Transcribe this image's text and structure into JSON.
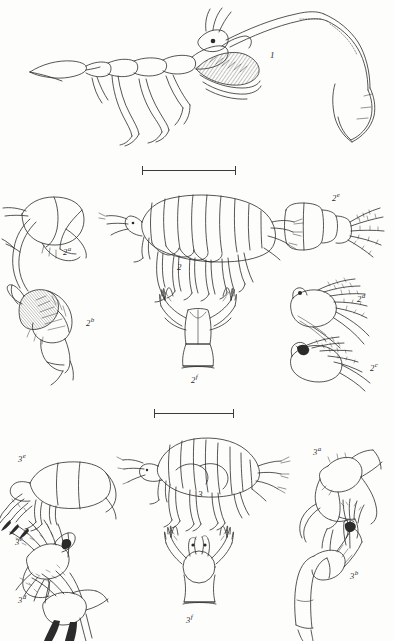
{
  "plate": {
    "background_color": "#fdfdfc",
    "ink_color": "#2b2b2b",
    "width": 395,
    "height": 641
  },
  "figures": [
    {
      "id": "fig-1",
      "number": "1",
      "suffix": "",
      "label_x": 270,
      "label_y": 51,
      "label_size": "main",
      "subject": "enlarged-segmented-appendage-with-hatched-shading"
    },
    {
      "id": "fig-2a",
      "number": "2",
      "suffix": "a",
      "label_x": 63,
      "label_y": 246,
      "label_size": "sub",
      "subject": "head-with-curved-antenna"
    },
    {
      "id": "fig-2",
      "number": "2",
      "suffix": "",
      "label_x": 177,
      "label_y": 263,
      "label_size": "main",
      "subject": "amphipod-whole-body-lateral-view"
    },
    {
      "id": "fig-2e",
      "number": "2",
      "suffix": "e",
      "label_x": 332,
      "label_y": 192,
      "label_size": "sub",
      "subject": "pleon-segments-with-uropods"
    },
    {
      "id": "fig-2b",
      "number": "2",
      "suffix": "b",
      "label_x": 86,
      "label_y": 317,
      "label_size": "sub",
      "subject": "gnathopod-with-shaded-propodus"
    },
    {
      "id": "fig-2f",
      "number": "2",
      "suffix": "f",
      "label_x": 191,
      "label_y": 374,
      "label_size": "sub",
      "subject": "telson-and-uropods-dorsal-view"
    },
    {
      "id": "fig-2d",
      "number": "2",
      "suffix": "d",
      "label_x": 357,
      "label_y": 293,
      "label_size": "sub",
      "subject": "setose-appendage-upper"
    },
    {
      "id": "fig-2c",
      "number": "2",
      "suffix": "c",
      "label_x": 370,
      "label_y": 362,
      "label_size": "sub",
      "subject": "setose-appendage-lower"
    },
    {
      "id": "fig-3e",
      "number": "3",
      "suffix": "e",
      "label_x": 18,
      "label_y": 453,
      "label_size": "sub",
      "subject": "head-and-anterior-segments"
    },
    {
      "id": "fig-3",
      "number": "3",
      "suffix": "",
      "label_x": 198,
      "label_y": 490,
      "label_size": "main",
      "subject": "amphipod-whole-body-lateral-view-small"
    },
    {
      "id": "fig-3a",
      "number": "3",
      "suffix": "a",
      "label_x": 313,
      "label_y": 446,
      "label_size": "sub",
      "subject": "gnathopod-lateral"
    },
    {
      "id": "fig-3c",
      "number": "3",
      "suffix": "c",
      "label_x": 15,
      "label_y": 536,
      "label_size": "sub",
      "subject": "setose-appendage-upper"
    },
    {
      "id": "fig-3d",
      "number": "3",
      "suffix": "d",
      "label_x": 18,
      "label_y": 594,
      "label_size": "sub",
      "subject": "setose-appendage-lower"
    },
    {
      "id": "fig-3f",
      "number": "3",
      "suffix": "f",
      "label_x": 186,
      "label_y": 614,
      "label_size": "sub",
      "subject": "telson-and-uropods-dorsal-view"
    },
    {
      "id": "fig-3b",
      "number": "3",
      "suffix": "b",
      "label_x": 350,
      "label_y": 570,
      "label_size": "sub",
      "subject": "pereopod-with-terminal-setae"
    }
  ],
  "scale_bars": [
    {
      "id": "scale-bar-upper",
      "x": 142,
      "y": 166,
      "width": 94
    },
    {
      "id": "scale-bar-lower",
      "x": 154,
      "y": 409,
      "width": 80
    }
  ]
}
